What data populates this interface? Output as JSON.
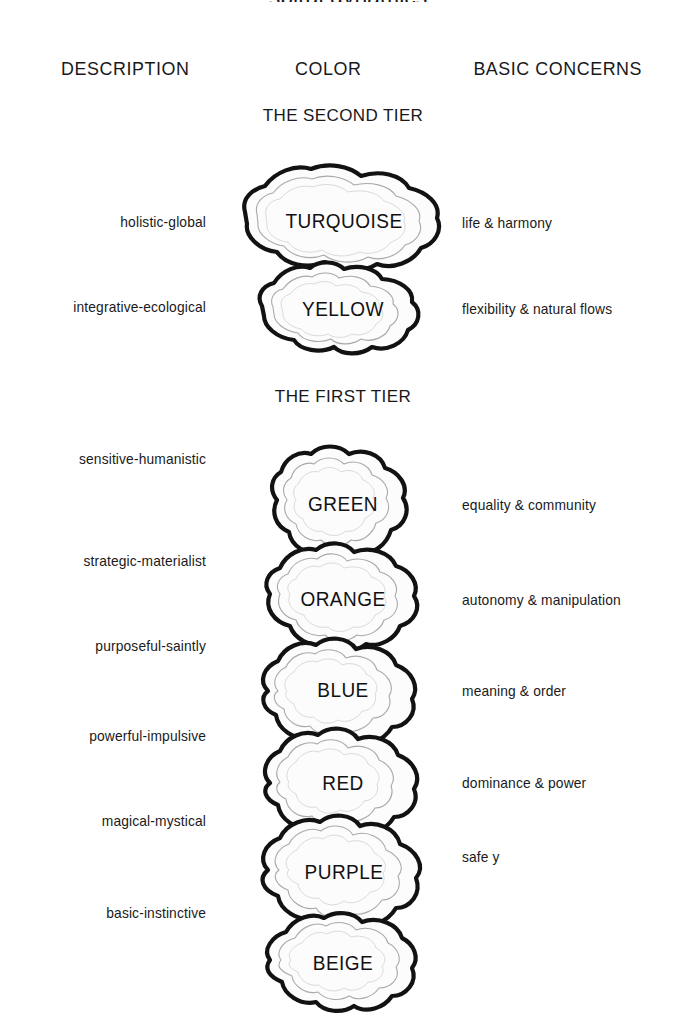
{
  "page": {
    "title_partial": "spiral dynamics",
    "background": "#ffffff",
    "ink": "#121212"
  },
  "headers": {
    "description": "DESCRIPTION",
    "color": "COLOR",
    "concerns": "BASIC CONCERNS"
  },
  "tiers": [
    {
      "label": "THE SECOND TIER"
    },
    {
      "label": "THE FIRST TIER"
    }
  ],
  "rows": [
    {
      "description": "holistic-global",
      "color": "TURQUOISE",
      "concern": "life & harmony",
      "tier": "second"
    },
    {
      "description": "integrative-ecological",
      "color": "YELLOW",
      "concern": "flexibility & natural flows",
      "tier": "second"
    },
    {
      "description": "sensitive-humanistic",
      "color": "GREEN",
      "concern": "equality & community",
      "tier": "first"
    },
    {
      "description": "strategic-materialist",
      "color": "ORANGE",
      "concern": "autonomy & manipulation",
      "tier": "first"
    },
    {
      "description": "purposeful-saintly",
      "color": "BLUE",
      "concern": "meaning & order",
      "tier": "first"
    },
    {
      "description": "powerful-impulsive",
      "color": "RED",
      "concern": "dominance & power",
      "tier": "first"
    },
    {
      "description": "magical-mystical",
      "color": "PURPLE",
      "concern": "safe y",
      "tier": "first"
    },
    {
      "description": "basic-instinctive",
      "color": "BEIGE",
      "concern": "",
      "tier": "first"
    }
  ]
}
